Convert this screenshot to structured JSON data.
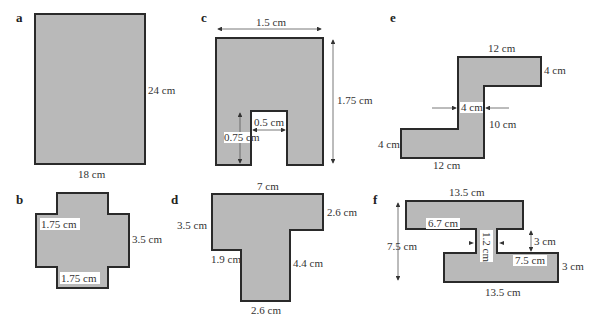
{
  "figure": {
    "panels": [
      {
        "id": "a",
        "label": "a",
        "shape": "rectangle",
        "dims": {
          "height": "24 cm",
          "width": "18 cm"
        }
      },
      {
        "id": "b",
        "label": "b",
        "shape": "cross",
        "dims": {
          "inner_top": "1.75 cm",
          "right": "3.5 cm",
          "inner_bottom": "1.75 cm"
        }
      },
      {
        "id": "c",
        "label": "c",
        "shape": "notched-rectangle",
        "dims": {
          "width": "1.5 cm",
          "height": "1.75 cm",
          "notch_width": "0.5 cm",
          "notch_height": "0.75 cm"
        }
      },
      {
        "id": "d",
        "label": "d",
        "shape": "T-shape",
        "dims": {
          "top": "7 cm",
          "right_top": "2.6 cm",
          "left": "3.5 cm",
          "left_step": "1.9 cm",
          "stem_right": "4.4 cm",
          "bottom": "2.6 cm"
        }
      },
      {
        "id": "e",
        "label": "e",
        "shape": "Z-shape",
        "dims": {
          "top": "12 cm",
          "top_right": "4 cm",
          "stem_width": "4 cm",
          "stem_height": "10 cm",
          "bottom_left": "4 cm",
          "bottom": "12 cm"
        }
      },
      {
        "id": "f",
        "label": "f",
        "shape": "I-beam",
        "dims": {
          "top": "13.5 cm",
          "inner_top": "6.7 cm",
          "stem_width": "1.2 cm",
          "gap": "3 cm",
          "inner_bottom": "7.5 cm",
          "right": "3 cm",
          "total_height": "7.5 cm",
          "bottom": "13.5 cm"
        }
      }
    ]
  },
  "colors": {
    "fill": "#b9b9b9",
    "stroke": "#2a2a2a",
    "background": "#ffffff"
  }
}
